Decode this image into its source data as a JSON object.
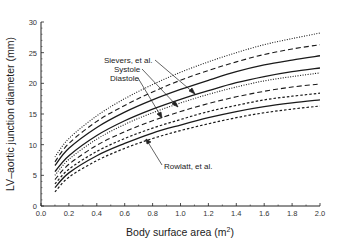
{
  "chart_data": {
    "type": "line",
    "title": "",
    "xlabel": "Body surface area (m²)",
    "xlabel_base": "Body surface area (m",
    "xlabel_sup": "2",
    "xlabel_end": ")",
    "ylabel": "LV–aortic junction diameter (mm)",
    "xlim": [
      0.0,
      2.0
    ],
    "ylim": [
      0,
      30
    ],
    "xticks": [
      "0.0",
      "0.2",
      "0.4",
      "0.6",
      "0.8",
      "1.0",
      "1.2",
      "1.4",
      "1.6",
      "1.8",
      "2.0"
    ],
    "yticks": [
      "0",
      "5",
      "10",
      "15",
      "20",
      "25",
      "30"
    ],
    "grid": false,
    "legend": "none",
    "annotations": [
      {
        "text": "Sievers, et al.",
        "points_to": "upper dashed band"
      },
      {
        "text": "Systole",
        "points_to": "upper solid curve"
      },
      {
        "text": "Diastole",
        "points_to": "second solid curve"
      },
      {
        "text": "Rowlatt, et al.",
        "points_to": "lower band"
      }
    ],
    "x": [
      0.1,
      0.2,
      0.4,
      0.6,
      0.8,
      1.0,
      1.2,
      1.4,
      1.6,
      1.8,
      2.0
    ],
    "series": [
      {
        "name": "Systole upper bound",
        "style": "dotted",
        "values": [
          8.0,
          11.0,
          14.7,
          17.5,
          19.8,
          21.8,
          23.5,
          25.0,
          26.3,
          27.3,
          28.2
        ]
      },
      {
        "name": "Sievers, et al. upper",
        "style": "dashed",
        "values": [
          7.2,
          10.2,
          13.8,
          16.4,
          18.6,
          20.5,
          22.1,
          23.5,
          24.7,
          25.6,
          26.3
        ]
      },
      {
        "name": "Systole",
        "style": "solid",
        "values": [
          6.6,
          9.4,
          12.8,
          15.3,
          17.3,
          19.0,
          20.5,
          21.9,
          23.0,
          23.8,
          24.5
        ]
      },
      {
        "name": "Diastole",
        "style": "solid",
        "values": [
          5.6,
          8.2,
          11.5,
          13.9,
          15.8,
          17.4,
          18.8,
          20.1,
          21.1,
          21.9,
          22.5
        ]
      },
      {
        "name": "Systole lower bound",
        "style": "dotted",
        "values": [
          5.0,
          7.6,
          10.9,
          13.3,
          15.2,
          16.8,
          18.2,
          19.4,
          20.4,
          21.1,
          21.7
        ]
      },
      {
        "name": "Sievers, et al. lower",
        "style": "dashed",
        "values": [
          4.3,
          6.8,
          9.9,
          12.1,
          13.9,
          15.4,
          16.7,
          17.8,
          18.7,
          19.4,
          19.9
        ]
      },
      {
        "name": "Rowlatt, et al. upper",
        "style": "short-dash",
        "values": [
          3.6,
          6.0,
          8.9,
          11.0,
          12.7,
          14.1,
          15.4,
          16.4,
          17.3,
          17.9,
          18.4
        ]
      },
      {
        "name": "Diastole mean (Rowlatt)",
        "style": "solid",
        "values": [
          3.0,
          5.4,
          8.2,
          10.2,
          11.9,
          13.2,
          14.4,
          15.4,
          16.2,
          16.8,
          17.3
        ]
      },
      {
        "name": "Rowlatt, et al. lower",
        "style": "short-dash",
        "values": [
          2.3,
          4.7,
          7.4,
          9.4,
          11.0,
          12.3,
          13.4,
          14.4,
          15.2,
          15.8,
          16.3
        ]
      }
    ]
  }
}
